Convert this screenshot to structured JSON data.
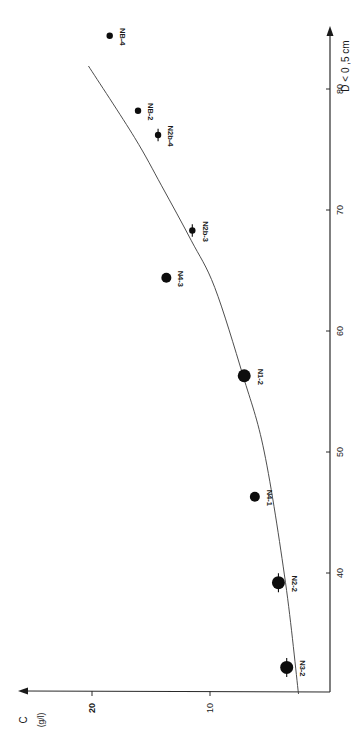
{
  "chart_data": {
    "type": "scatter",
    "orientation": "rotated-90deg (x axis drawn vertically on right, y axis drawn horizontally along bottom increasing leftward)",
    "title": "",
    "xlabel": "D < 0 ,5 cm",
    "ylabel": "C",
    "ylabel_unit": "(g/l)",
    "x_ticks": [
      40,
      50,
      60,
      70,
      80
    ],
    "y_ticks": [
      10,
      20
    ],
    "xlim": [
      30,
      86
    ],
    "ylim": [
      0,
      22
    ],
    "grid": false,
    "legend": null,
    "series": [
      {
        "name": "samples",
        "points": [
          {
            "label": "N3-2",
            "x": 32.2,
            "y": 3.5,
            "size": "large",
            "error_bar": true
          },
          {
            "label": "N2-2",
            "x": 39.2,
            "y": 4.2,
            "size": "large",
            "error_bar": true
          },
          {
            "label": "N4-1",
            "x": 46.3,
            "y": 6.2,
            "size": "medium",
            "error_bar": false
          },
          {
            "label": "N1-2",
            "x": 56.3,
            "y": 7.1,
            "size": "large",
            "error_bar": false
          },
          {
            "label": "N4-3",
            "x": 64.4,
            "y": 13.7,
            "size": "medium",
            "error_bar": false
          },
          {
            "label": "N2b-3",
            "x": 68.3,
            "y": 11.5,
            "size": "small",
            "error_bar": true
          },
          {
            "label": "N2b-4",
            "x": 76.2,
            "y": 14.4,
            "size": "small",
            "error_bar": true
          },
          {
            "label": "NB-2",
            "x": 78.2,
            "y": 16.1,
            "size": "small",
            "error_bar": false
          },
          {
            "label": "NB-4",
            "x": 84.4,
            "y": 18.5,
            "size": "small",
            "error_bar": false
          }
        ]
      },
      {
        "name": "fitted curve",
        "type": "line",
        "points": [
          {
            "x": 30.0,
            "y": 2.5
          },
          {
            "x": 39.2,
            "y": 3.6
          },
          {
            "x": 50.0,
            "y": 5.4
          },
          {
            "x": 56.3,
            "y": 7.2
          },
          {
            "x": 63.6,
            "y": 9.6
          },
          {
            "x": 67.5,
            "y": 11.6
          },
          {
            "x": 72.0,
            "y": 14.1
          },
          {
            "x": 76.0,
            "y": 16.4
          },
          {
            "x": 81.9,
            "y": 20.3
          }
        ]
      }
    ]
  },
  "layout": {
    "origin_px": [
      330,
      692
    ],
    "x_axis_px_per_unit": 12.1,
    "x_axis_ref": {
      "value": 80,
      "px": 89
    },
    "y_axis_px_per_unit": 11.8,
    "y_axis_zero_px": 328,
    "marker_radius": {
      "small": 3.2,
      "medium": 5,
      "large": 6.5
    }
  },
  "labels": {
    "x_axis_title": "D < 0 ,5 cm",
    "y_axis_title": "C",
    "y_axis_unit": "(g/l)"
  }
}
